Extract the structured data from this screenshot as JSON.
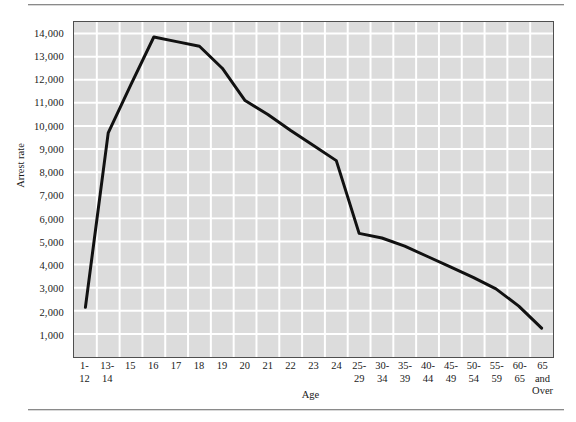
{
  "figure": {
    "has_top_rule": true,
    "has_bottom_rule": true
  },
  "chart_data": {
    "type": "line",
    "title": "",
    "xlabel": "Age",
    "ylabel": "Arrest rate",
    "categories": [
      "1-\n12",
      "13-\n14",
      "15",
      "16",
      "17",
      "18",
      "19",
      "20",
      "21",
      "22",
      "23",
      "24",
      "25-\n29",
      "30-\n34",
      "35-\n39",
      "40-\n44",
      "45-\n49",
      "50-\n54",
      "55-\n59",
      "60-\n65",
      "65 and\nOver"
    ],
    "categories_plain": [
      "1-12",
      "13-14",
      "15",
      "16",
      "17",
      "18",
      "19",
      "20",
      "21",
      "22",
      "23",
      "24",
      "25-29",
      "30-34",
      "35-39",
      "40-44",
      "45-49",
      "50-54",
      "55-59",
      "60-65",
      "65 and Over"
    ],
    "values": [
      2150,
      9700,
      11800,
      13850,
      13650,
      13450,
      12500,
      11100,
      10500,
      9800,
      9150,
      8500,
      5350,
      5150,
      4800,
      4350,
      3900,
      3450,
      2950,
      2200,
      1250
    ],
    "series": [
      {
        "name": "Arrest rate",
        "values": [
          2150,
          9700,
          11800,
          13850,
          13650,
          13450,
          12500,
          11100,
          10500,
          9800,
          9150,
          8500,
          5350,
          5150,
          4800,
          4350,
          3900,
          3450,
          2950,
          2200,
          1250
        ],
        "color": "#111111",
        "line_width": 3
      }
    ],
    "ylim": [
      0,
      14500
    ],
    "yticks": [
      1000,
      2000,
      3000,
      4000,
      5000,
      6000,
      7000,
      8000,
      9000,
      10000,
      11000,
      12000,
      13000,
      14000
    ],
    "ytick_labels": [
      "1,000",
      "2,000",
      "3,000",
      "4,000",
      "5,000",
      "6,000",
      "7,000",
      "8,000",
      "9,000",
      "10,000",
      "11,000",
      "12,000",
      "13,000",
      "14,000"
    ],
    "grid": true,
    "grid_color": "#ffffff",
    "plot_background": "#dcdcdc",
    "legend": "none",
    "marker": "none"
  }
}
